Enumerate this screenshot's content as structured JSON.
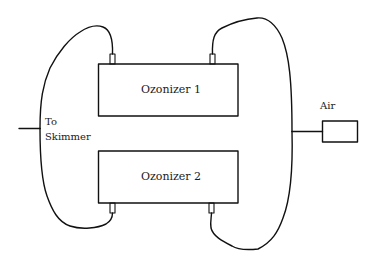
{
  "diagram": {
    "type": "ozonizer plumbing schematic",
    "stroke_color": "#111111",
    "background": "#ffffff",
    "components": {
      "ozonizer_1": {
        "label": "Ozonizer 1"
      },
      "ozonizer_2": {
        "label": "Ozonizer 2"
      },
      "air_pump": {
        "label": "Air"
      },
      "skimmer_outlet": {
        "label_line1": "To",
        "label_line2": "Skimmer"
      }
    },
    "connections": [
      {
        "from": "air_pump",
        "to": "ozonizer_1 (top-right port)"
      },
      {
        "from": "air_pump",
        "to": "ozonizer_2 (bottom-right port)"
      },
      {
        "from": "ozonizer_1 (top-left port)",
        "to": "skimmer_outlet"
      },
      {
        "from": "ozonizer_2 (bottom-left port)",
        "to": "skimmer_outlet"
      }
    ]
  }
}
